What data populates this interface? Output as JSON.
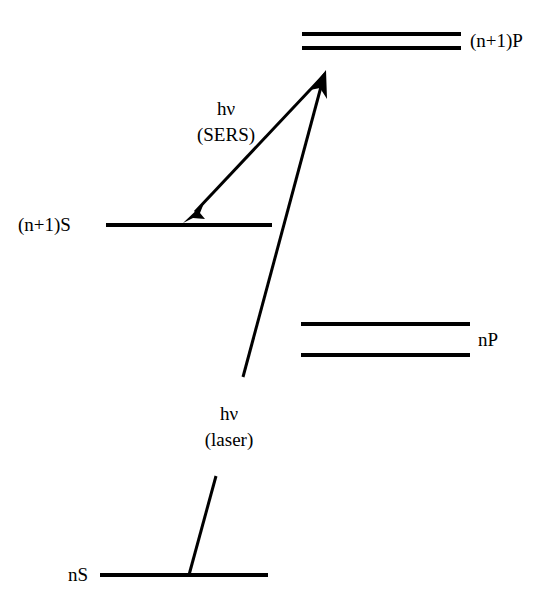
{
  "figure": {
    "kind": "energy-level-diagram",
    "width": 557,
    "height": 608,
    "background_color": "#ffffff",
    "ink_color": "#000000"
  },
  "levels": [
    {
      "id": "n-plus-1-P",
      "label": "(n+1)P",
      "label_side": "right",
      "label_x": 470,
      "label_y": 41,
      "multiplicity": 2,
      "lines": [
        {
          "x1": 302,
          "y1": 34,
          "x2": 461,
          "y2": 34
        },
        {
          "x1": 302,
          "y1": 48,
          "x2": 461,
          "y2": 48
        }
      ]
    },
    {
      "id": "n-plus-1-S",
      "label": "(n+1)S",
      "label_side": "left",
      "label_x": 18,
      "label_y": 225,
      "multiplicity": 1,
      "lines": [
        {
          "x1": 106,
          "y1": 225,
          "x2": 272,
          "y2": 225
        }
      ]
    },
    {
      "id": "nP",
      "label": "nP",
      "label_side": "right",
      "label_x": 478,
      "label_y": 340,
      "multiplicity": 2,
      "lines": [
        {
          "x1": 301,
          "y1": 324,
          "x2": 470,
          "y2": 324
        },
        {
          "x1": 301,
          "y1": 355,
          "x2": 470,
          "y2": 355
        }
      ]
    },
    {
      "id": "nS",
      "label": "nS",
      "label_side": "left",
      "label_x": 68,
      "label_y": 575,
      "multiplicity": 1,
      "lines": [
        {
          "x1": 100,
          "y1": 575,
          "x2": 268,
          "y2": 575
        }
      ]
    }
  ],
  "transitions": [
    {
      "id": "sers-emission",
      "label_lines": [
        "hν",
        "(SERS)"
      ],
      "label_x": 226,
      "label_y": 98,
      "direction": "down-left",
      "from": {
        "x": 325,
        "y": 73
      },
      "to": {
        "x": 184,
        "y": 222
      },
      "arrowhead_at": "to",
      "broken_by_label": false
    },
    {
      "id": "laser-excitation",
      "label_lines": [
        "hν",
        "(laser)"
      ],
      "label_x": 229,
      "label_y": 403,
      "direction": "up-right",
      "from": {
        "x": 189,
        "y": 575
      },
      "to": {
        "x": 326,
        "y": 71
      },
      "arrowhead_at": "to",
      "broken_by_label": true,
      "break_segment": {
        "x1": 216,
        "y1": 476,
        "x2": 243,
        "y2": 377
      }
    }
  ]
}
